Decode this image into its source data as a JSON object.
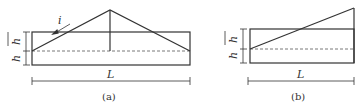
{
  "figure_a": {
    "caption": "(a)",
    "length_label": "L",
    "height_label_top": "h",
    "height_label_bottom": "h",
    "slope_label": "i"
  },
  "figure_b": {
    "caption": "(b)",
    "length_label": "L",
    "height_label_top": "h",
    "height_label_bottom": "h"
  },
  "colors": {
    "line": "#333333",
    "dashed": "#555555"
  }
}
